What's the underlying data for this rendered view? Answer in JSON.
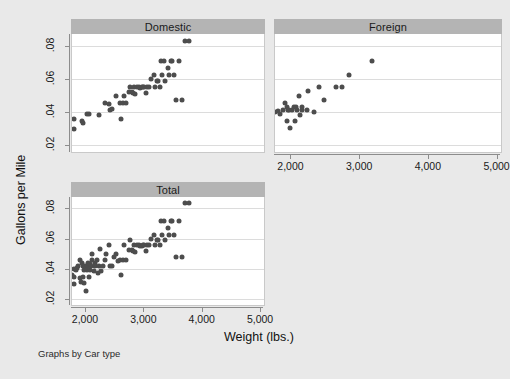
{
  "figure": {
    "note": "Graphs by Car type",
    "axis_titles": {
      "y": "Gallons per Mile",
      "x": "Weight (lbs.)"
    },
    "background_color": "#e9e9e9",
    "panel_title_color": "#b4b4b4",
    "marker_color": "#4d4d4d",
    "plot_bg": "#ffffff"
  },
  "chart_data": {
    "type": "scatter",
    "title": "",
    "xlabel": "Weight (lbs.)",
    "ylabel": "Gallons per Mile",
    "xlim": [
      1760,
      5050
    ],
    "ylim": [
      0.016,
      0.0875
    ],
    "xticks": [
      2000,
      3000,
      4000,
      5000
    ],
    "xticklabels": [
      "2,000",
      "3,000",
      "4,000",
      "5,000"
    ],
    "yticks": [
      0.02,
      0.04,
      0.06,
      0.08
    ],
    "yticklabels": [
      ".02",
      ".04",
      ".06",
      ".08"
    ],
    "grid": "horizontal",
    "legend": "none",
    "by_variable": "Car type",
    "panels": [
      {
        "name": "Domestic",
        "points": [
          [
            1800,
            0.0357
          ],
          [
            1800,
            0.0299
          ],
          [
            1930,
            0.0345
          ],
          [
            1950,
            0.0336
          ],
          [
            2020,
            0.0391
          ],
          [
            2050,
            0.0389
          ],
          [
            2230,
            0.0385
          ],
          [
            2330,
            0.0455
          ],
          [
            2400,
            0.0448
          ],
          [
            2410,
            0.0417
          ],
          [
            2440,
            0.042
          ],
          [
            2520,
            0.05
          ],
          [
            2580,
            0.0454
          ],
          [
            2600,
            0.0357
          ],
          [
            2640,
            0.0455
          ],
          [
            2650,
            0.05
          ],
          [
            2690,
            0.0455
          ],
          [
            2730,
            0.0526
          ],
          [
            2750,
            0.0556
          ],
          [
            2780,
            0.0526
          ],
          [
            2800,
            0.052
          ],
          [
            2830,
            0.0555
          ],
          [
            2840,
            0.0513
          ],
          [
            2870,
            0.0556
          ],
          [
            2900,
            0.0556
          ],
          [
            2930,
            0.0548
          ],
          [
            2960,
            0.0552
          ],
          [
            2980,
            0.0555
          ],
          [
            3000,
            0.0556
          ],
          [
            3020,
            0.052
          ],
          [
            3050,
            0.0555
          ],
          [
            3080,
            0.0556
          ],
          [
            3110,
            0.06
          ],
          [
            3170,
            0.0625
          ],
          [
            3190,
            0.0555
          ],
          [
            3220,
            0.059
          ],
          [
            3240,
            0.0588
          ],
          [
            3260,
            0.0555
          ],
          [
            3290,
            0.0714
          ],
          [
            3310,
            0.0625
          ],
          [
            3340,
            0.0714
          ],
          [
            3360,
            0.0588
          ],
          [
            3400,
            0.0667
          ],
          [
            3420,
            0.0625
          ],
          [
            3450,
            0.0714
          ],
          [
            3480,
            0.0714
          ],
          [
            3500,
            0.0625
          ],
          [
            3540,
            0.0476
          ],
          [
            3600,
            0.0714
          ],
          [
            3640,
            0.0476
          ],
          [
            3700,
            0.0833
          ],
          [
            3760,
            0.0833
          ]
        ]
      },
      {
        "name": "Foreign",
        "points": [
          [
            1760,
            0.04
          ],
          [
            1800,
            0.0408
          ],
          [
            1830,
            0.039
          ],
          [
            1870,
            0.0417
          ],
          [
            1900,
            0.0455
          ],
          [
            1930,
            0.0435
          ],
          [
            1940,
            0.0345
          ],
          [
            1950,
            0.0417
          ],
          [
            1960,
            0.0417
          ],
          [
            1980,
            0.0303
          ],
          [
            2010,
            0.0417
          ],
          [
            2030,
            0.0435
          ],
          [
            2050,
            0.0345
          ],
          [
            2070,
            0.0434
          ],
          [
            2080,
            0.0417
          ],
          [
            2110,
            0.05
          ],
          [
            2130,
            0.0385
          ],
          [
            2150,
            0.0435
          ],
          [
            2160,
            0.0417
          ],
          [
            2230,
            0.0417
          ],
          [
            2240,
            0.0528
          ],
          [
            2330,
            0.04
          ],
          [
            2400,
            0.0555
          ],
          [
            2480,
            0.0476
          ],
          [
            2650,
            0.0555
          ],
          [
            2730,
            0.0556
          ],
          [
            2830,
            0.0625
          ],
          [
            3170,
            0.0714
          ]
        ]
      },
      {
        "name": "Total",
        "points": [
          [
            1760,
            0.0357
          ],
          [
            1790,
            0.0299
          ],
          [
            1800,
            0.04
          ],
          [
            1800,
            0.0345
          ],
          [
            1830,
            0.0389
          ],
          [
            1850,
            0.0408
          ],
          [
            1870,
            0.0417
          ],
          [
            1890,
            0.0336
          ],
          [
            1900,
            0.0455
          ],
          [
            1910,
            0.031
          ],
          [
            1930,
            0.0435
          ],
          [
            1940,
            0.0345
          ],
          [
            1950,
            0.0417
          ],
          [
            1960,
            0.0389
          ],
          [
            1970,
            0.0303
          ],
          [
            1980,
            0.0417
          ],
          [
            2000,
            0.025
          ],
          [
            2010,
            0.0417
          ],
          [
            2020,
            0.0391
          ],
          [
            2030,
            0.0435
          ],
          [
            2050,
            0.0345
          ],
          [
            2060,
            0.0389
          ],
          [
            2070,
            0.0434
          ],
          [
            2080,
            0.0417
          ],
          [
            2100,
            0.0455
          ],
          [
            2110,
            0.05
          ],
          [
            2130,
            0.0385
          ],
          [
            2150,
            0.0435
          ],
          [
            2160,
            0.0417
          ],
          [
            2180,
            0.0455
          ],
          [
            2200,
            0.037
          ],
          [
            2230,
            0.0417
          ],
          [
            2240,
            0.0528
          ],
          [
            2260,
            0.0385
          ],
          [
            2290,
            0.0417
          ],
          [
            2330,
            0.0455
          ],
          [
            2350,
            0.05
          ],
          [
            2400,
            0.0555
          ],
          [
            2410,
            0.0417
          ],
          [
            2440,
            0.042
          ],
          [
            2480,
            0.0476
          ],
          [
            2520,
            0.05
          ],
          [
            2550,
            0.0454
          ],
          [
            2580,
            0.0455
          ],
          [
            2600,
            0.0357
          ],
          [
            2640,
            0.0455
          ],
          [
            2650,
            0.0556
          ],
          [
            2690,
            0.0455
          ],
          [
            2730,
            0.0526
          ],
          [
            2750,
            0.059
          ],
          [
            2780,
            0.0526
          ],
          [
            2800,
            0.052
          ],
          [
            2830,
            0.0555
          ],
          [
            2840,
            0.0513
          ],
          [
            2870,
            0.0556
          ],
          [
            2900,
            0.0556
          ],
          [
            2930,
            0.0548
          ],
          [
            2960,
            0.0552
          ],
          [
            2980,
            0.0555
          ],
          [
            3000,
            0.0556
          ],
          [
            3020,
            0.052
          ],
          [
            3050,
            0.0555
          ],
          [
            3080,
            0.0556
          ],
          [
            3110,
            0.06
          ],
          [
            3170,
            0.0625
          ],
          [
            3190,
            0.0555
          ],
          [
            3220,
            0.059
          ],
          [
            3240,
            0.0588
          ],
          [
            3260,
            0.0555
          ],
          [
            3290,
            0.0714
          ],
          [
            3310,
            0.0625
          ],
          [
            3340,
            0.0714
          ],
          [
            3360,
            0.0588
          ],
          [
            3400,
            0.0667
          ],
          [
            3420,
            0.0625
          ],
          [
            3450,
            0.0714
          ],
          [
            3480,
            0.0714
          ],
          [
            3500,
            0.0625
          ],
          [
            3540,
            0.0476
          ],
          [
            3600,
            0.0714
          ],
          [
            3640,
            0.0476
          ],
          [
            3700,
            0.0833
          ],
          [
            3760,
            0.0833
          ]
        ]
      }
    ]
  }
}
